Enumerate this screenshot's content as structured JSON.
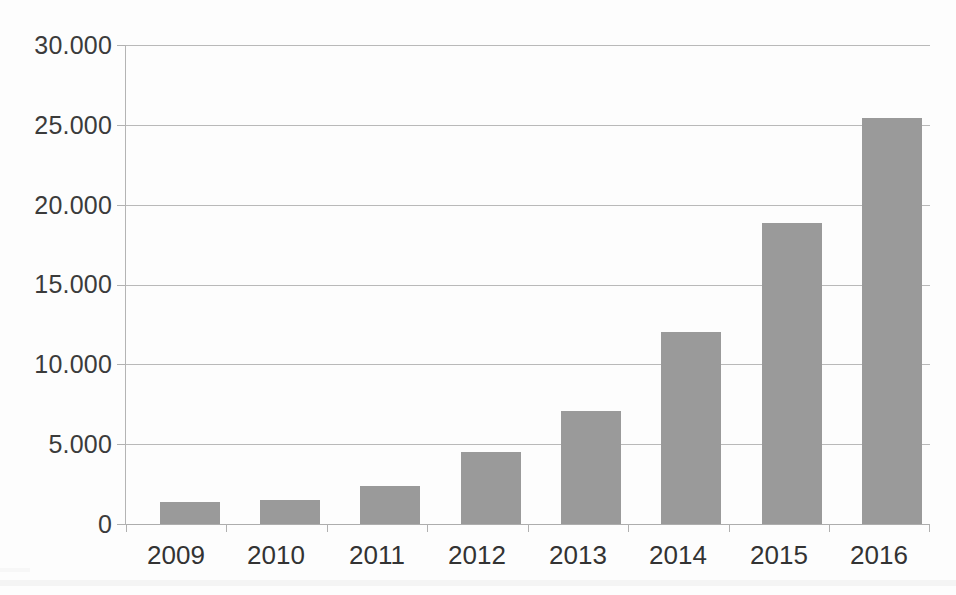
{
  "chart_data": {
    "type": "bar",
    "title": "",
    "subtitle": "",
    "xlabel": "",
    "ylabel": "",
    "categories": [
      "2009",
      "2010",
      "2011",
      "2012",
      "2013",
      "2014",
      "2015",
      "2016"
    ],
    "values": [
      1400,
      1500,
      2350,
      4500,
      7050,
      12050,
      18850,
      25400
    ],
    "series": [
      {
        "name": "",
        "values": [
          1400,
          1500,
          2350,
          4500,
          7050,
          12050,
          18850,
          25400
        ]
      }
    ],
    "ylim": [
      0,
      30000
    ],
    "yticks": [
      0,
      5000,
      10000,
      15000,
      20000,
      25000,
      30000
    ],
    "ytick_labels": [
      "0",
      "5.000",
      "10.000",
      "15.000",
      "20.000",
      "25.000",
      "30.000"
    ],
    "grid": true,
    "grid_axis": "y",
    "legend": false,
    "legend_position": "none",
    "bar_color": "#9a9a9a",
    "grid_color": "#b9b9b9",
    "axis_color": "#adadad",
    "text_color": "#3a3a3a",
    "background_color": "#ffffff",
    "number_format": "european-dot-thousands"
  }
}
